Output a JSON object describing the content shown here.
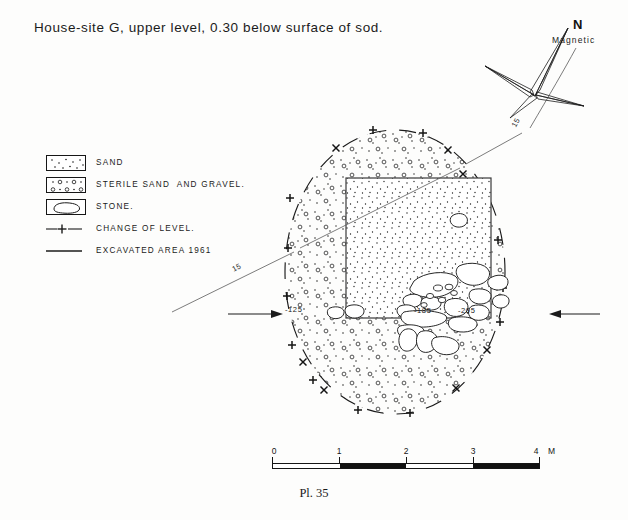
{
  "title": "House-site G, upper level, 0.30 below surface of sod.",
  "north": {
    "letter": "N",
    "sublabel": "Magnetic",
    "declination_label": "15"
  },
  "legend": {
    "items": [
      {
        "symbol": "sand-swatch",
        "label": "SAND"
      },
      {
        "symbol": "sterile-sand-gravel-swatch",
        "label": "STERILE SAND  AND GRAVEL."
      },
      {
        "symbol": "stone-swatch",
        "label": "STONE."
      },
      {
        "symbol": "change-of-level-line",
        "label": "CHANGE OF LEVEL."
      },
      {
        "symbol": "excavated-area-line",
        "label": "EXCAVATED AREA 1961"
      }
    ]
  },
  "map": {
    "datum_left_label": "-125",
    "elevation_a": "-185",
    "elevation_b": "-205",
    "leader_label_left": "15",
    "leader_label_right": "15"
  },
  "scale": {
    "ticks": [
      "0",
      "1",
      "2",
      "3",
      "4"
    ],
    "unit": "M",
    "min": 0,
    "max": 4
  },
  "caption": "Pl. 35",
  "colors": {
    "ink": "#151515",
    "paper": "#fdfdfc"
  }
}
